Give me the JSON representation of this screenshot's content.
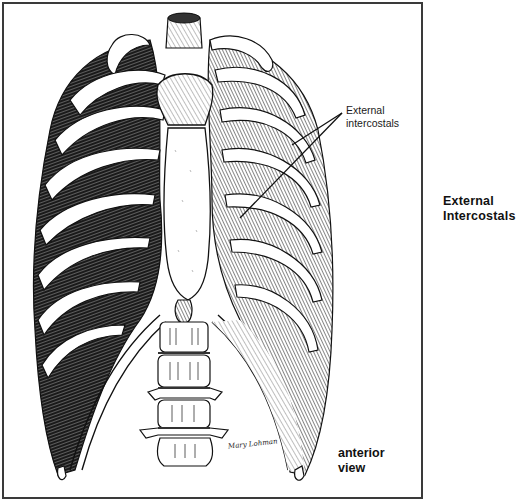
{
  "figure": {
    "callout_label": {
      "line1": "External",
      "line2": "intercostals"
    },
    "side_title": {
      "line1": "External",
      "line2": "Intercostals"
    },
    "view_label": {
      "line1": "anterior",
      "line2": "view"
    },
    "signature": "Mary Lohman",
    "colors": {
      "ink": "#111111",
      "frame": "#3a3a3a",
      "background": "#ffffff"
    }
  }
}
